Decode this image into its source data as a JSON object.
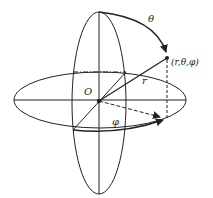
{
  "diagram": {
    "labels": {
      "theta": "θ",
      "point": "(r,θ,φ)",
      "r": "r",
      "origin": "O",
      "phi": "φ"
    },
    "colors": {
      "stroke": "#222222",
      "background": "#ffffff"
    }
  }
}
